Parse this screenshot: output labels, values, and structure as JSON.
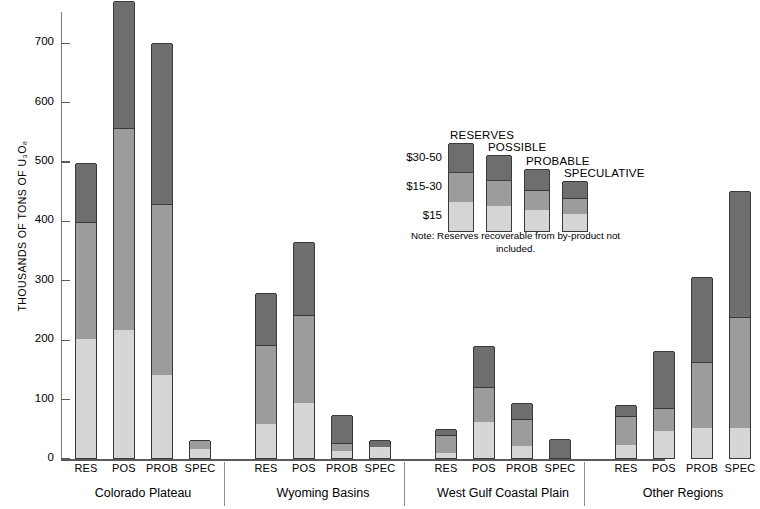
{
  "chart_data": {
    "type": "bar",
    "subtype": "stacked-grouped",
    "title": "",
    "xlabel": "",
    "ylabel": "THOUSANDS OF TONS OF U₃O₈",
    "ylim": [
      0,
      780
    ],
    "yticks": [
      0,
      100,
      200,
      300,
      400,
      500,
      600,
      700
    ],
    "ytick_labels": [
      "0",
      "100",
      "200",
      "300",
      "400",
      "500",
      "600",
      "700"
    ],
    "grid": false,
    "legend_position": "center-right",
    "stack_order_bottom_to_top": [
      "$15",
      "$15-30",
      "$30-50"
    ],
    "series": [
      {
        "name": "$15",
        "color": "#d6d6d6",
        "values": [
          200,
          215,
          140,
          15,
          58,
          93,
          12,
          18,
          8,
          60,
          20,
          0,
          22,
          45,
          50,
          50
        ]
      },
      {
        "name": "$15-30",
        "color": "#9c9c9c",
        "values": [
          197,
          340,
          288,
          15,
          132,
          148,
          13,
          0,
          30,
          60,
          45,
          0,
          48,
          40,
          112,
          187
        ]
      },
      {
        "name": "$30-50",
        "color": "#6e6e6e",
        "values": [
          100,
          215,
          270,
          0,
          88,
          122,
          47,
          12,
          10,
          68,
          28,
          32,
          20,
          95,
          143,
          213
        ]
      }
    ],
    "categories": [
      "RES",
      "POS",
      "PROB",
      "SPEC",
      "RES",
      "POS",
      "PROB",
      "SPEC",
      "RES",
      "POS",
      "PROB",
      "SPEC",
      "RES",
      "POS",
      "PROB",
      "SPEC"
    ],
    "totals": [
      497,
      770,
      698,
      30,
      278,
      363,
      72,
      30,
      48,
      188,
      93,
      32,
      90,
      180,
      305,
      450
    ],
    "groups": [
      {
        "name": "Colorado Plateau",
        "bars": [
          {
            "label": "RES",
            "segments": {
              "$15": 200,
              "$15-30": 197,
              "$30-50": 100
            },
            "total": 497
          },
          {
            "label": "POS",
            "segments": {
              "$15": 215,
              "$15-30": 340,
              "$30-50": 215
            },
            "total": 770
          },
          {
            "label": "PROB",
            "segments": {
              "$15": 140,
              "$15-30": 288,
              "$30-50": 270
            },
            "total": 698
          },
          {
            "label": "SPEC",
            "segments": {
              "$15": 15,
              "$15-30": 15,
              "$30-50": 0
            },
            "total": 30
          }
        ]
      },
      {
        "name": "Wyoming Basins",
        "bars": [
          {
            "label": "RES",
            "segments": {
              "$15": 58,
              "$15-30": 132,
              "$30-50": 88
            },
            "total": 278
          },
          {
            "label": "POS",
            "segments": {
              "$15": 93,
              "$15-30": 148,
              "$30-50": 122
            },
            "total": 363
          },
          {
            "label": "PROB",
            "segments": {
              "$15": 12,
              "$15-30": 13,
              "$30-50": 47
            },
            "total": 72
          },
          {
            "label": "SPEC",
            "segments": {
              "$15": 18,
              "$15-30": 0,
              "$30-50": 12
            },
            "total": 30
          }
        ]
      },
      {
        "name": "West Gulf Coastal Plain",
        "bars": [
          {
            "label": "RES",
            "segments": {
              "$15": 8,
              "$15-30": 30,
              "$30-50": 10
            },
            "total": 48
          },
          {
            "label": "POS",
            "segments": {
              "$15": 60,
              "$15-30": 60,
              "$30-50": 68
            },
            "total": 188
          },
          {
            "label": "PROB",
            "segments": {
              "$15": 20,
              "$15-30": 45,
              "$30-50": 28
            },
            "total": 93
          },
          {
            "label": "SPEC",
            "segments": {
              "$15": 0,
              "$15-30": 0,
              "$30-50": 32
            },
            "total": 32
          }
        ]
      },
      {
        "name": "Other Regions",
        "bars": [
          {
            "label": "RES",
            "segments": {
              "$15": 22,
              "$15-30": 48,
              "$30-50": 20
            },
            "total": 90
          },
          {
            "label": "POS",
            "segments": {
              "$15": 45,
              "$15-30": 40,
              "$30-50": 95
            },
            "total": 180
          },
          {
            "label": "PROB",
            "segments": {
              "$15": 50,
              "$15-30": 112,
              "$30-50": 143
            },
            "total": 305
          },
          {
            "label": "SPEC",
            "segments": {
              "$15": 50,
              "$15-30": 187,
              "$30-50": 213
            },
            "total": 450
          }
        ]
      }
    ],
    "legend": {
      "categories": [
        "RESERVES",
        "POSSIBLE",
        "PROBABLE",
        "SPECULATIVE"
      ],
      "price_labels": [
        "$30-50",
        "$15-30",
        "$15"
      ],
      "note": "Note: Reserves recoverable from by-product not included."
    },
    "colors": {
      "segment_15": "#d6d6d6",
      "segment_15_30": "#9c9c9c",
      "segment_30_50": "#6e6e6e",
      "outline": "#3a3a3a",
      "axis": "#7a7a7a",
      "background": "#ffffff"
    }
  }
}
